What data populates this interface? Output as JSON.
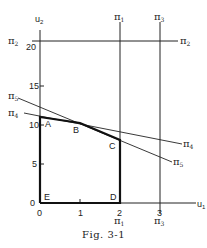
{
  "figure": {
    "caption": "Fig. 3-1",
    "axes": {
      "x_label": "u1",
      "y_label": "u2",
      "x_ticks": [
        "0",
        "1",
        "2",
        "3"
      ],
      "y_ticks": [
        "0",
        "5",
        "10",
        "15",
        "20"
      ]
    },
    "lines": [
      {
        "name": "π1",
        "label_top": "π1",
        "label_bottom": "π1",
        "equation": "u1 = 2"
      },
      {
        "name": "π2",
        "label_left": "π2",
        "label_right": "π2",
        "equation": "u2 = 21"
      },
      {
        "name": "π3",
        "label_top": "π3",
        "label_bottom": "π3",
        "equation": "u1 = 3"
      },
      {
        "name": "π4",
        "label_left": "π4",
        "label_right": "π4"
      },
      {
        "name": "π5",
        "label_left": "π5",
        "label_right": "π5"
      }
    ],
    "points": [
      {
        "label": "A",
        "u1": 0,
        "u2": 10.5
      },
      {
        "label": "B",
        "u1": 1,
        "u2": 10
      },
      {
        "label": "C",
        "u1": 2,
        "u2": 8
      },
      {
        "label": "D",
        "u1": 2,
        "u2": 0
      },
      {
        "label": "E",
        "u1": 0,
        "u2": 0
      }
    ]
  }
}
